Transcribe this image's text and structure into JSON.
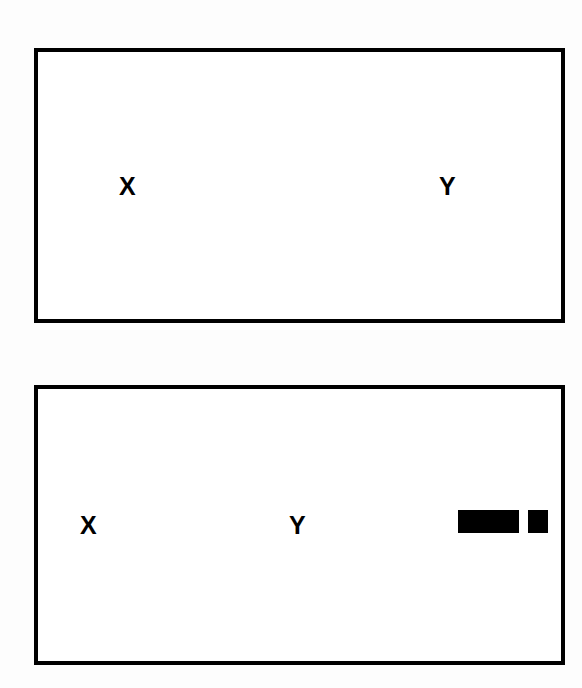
{
  "panels": [
    {
      "id": "panel-1",
      "labels": {
        "left": "X",
        "right": "Y"
      },
      "markers": []
    },
    {
      "id": "panel-2",
      "labels": {
        "left": "X",
        "right": "Y"
      },
      "markers": [
        {
          "type": "solid-bar",
          "shape": "long",
          "color": "#000000"
        },
        {
          "type": "solid-bar",
          "shape": "short",
          "color": "#000000"
        }
      ]
    }
  ],
  "colors": {
    "border": "#000000",
    "text": "#000000",
    "background": "#ffffff"
  }
}
